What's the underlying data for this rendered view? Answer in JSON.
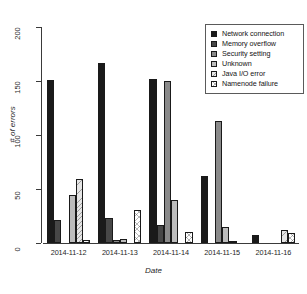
{
  "chart_data": {
    "type": "bar",
    "title": "",
    "subtitle": "",
    "xlabel": "Date",
    "ylabel": "# of errors",
    "categories": [
      "2014-11-12",
      "2014-11-13",
      "2014-11-14",
      "2014-11-15",
      "2014-11-16"
    ],
    "ylim": [
      0,
      200
    ],
    "yticks": [
      0,
      50,
      100,
      150,
      200
    ],
    "ytick_labels": [
      "0",
      "50",
      "100",
      "150",
      "200"
    ],
    "grid": false,
    "legend_position": "top-right",
    "series": [
      {
        "name": "Network connection",
        "color": "#1a1a1a",
        "values": [
          151,
          167,
          152,
          62,
          7
        ]
      },
      {
        "name": "Memory overflow",
        "color": "#474747",
        "values": [
          21,
          23,
          17,
          0,
          0
        ]
      },
      {
        "name": "Security setting",
        "color": "#8a8a8a",
        "values": [
          0,
          3,
          150,
          113,
          0
        ]
      },
      {
        "name": "Unknown",
        "color": "#bdbdbd",
        "values": [
          44,
          4,
          40,
          15,
          0
        ]
      },
      {
        "name": "Java I/O error",
        "color": "#e6e6e6",
        "values": [
          59,
          0,
          0,
          1,
          12
        ]
      },
      {
        "name": "Namenode failure",
        "color": "#ffffff",
        "values": [
          3,
          31,
          10,
          0,
          9
        ]
      }
    ]
  },
  "axes": {
    "y_title": "# of errors",
    "x_title": "Date",
    "y_tick_labels": [
      "0",
      "50",
      "100",
      "150",
      "200"
    ],
    "x_tick_labels": [
      "2014-11-12",
      "2014-11-13",
      "2014-11-14",
      "2014-11-15",
      "2014-11-16"
    ]
  },
  "legend": {
    "entries": [
      {
        "label": "Network connection",
        "swatch": "solid-black"
      },
      {
        "label": "Memory overflow",
        "swatch": "solid-darkgray"
      },
      {
        "label": "Security setting",
        "swatch": "solid-gray"
      },
      {
        "label": "Unknown",
        "swatch": "solid-lightgray"
      },
      {
        "label": "Java I/O error",
        "swatch": "hatched-diagonal"
      },
      {
        "label": "Namenode failure",
        "swatch": "crosshatched"
      }
    ]
  }
}
